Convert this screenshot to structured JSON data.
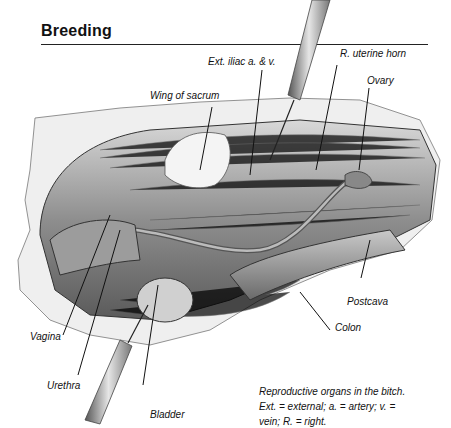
{
  "page": {
    "section_title": "Breeding"
  },
  "figure": {
    "labels": {
      "ext_iliac": "Ext. iliac a. & v.",
      "uterine_horn": "R. uterine horn",
      "ovary": "Ovary",
      "wing_sacrum": "Wing of sacrum",
      "postcava": "Postcava",
      "colon": "Colon",
      "vagina": "Vagina",
      "urethra": "Urethra",
      "bladder": "Bladder"
    },
    "caption": "Reproductive organs in the bitch. Ext. = external; a. = artery; v. = vein; R. = right."
  }
}
